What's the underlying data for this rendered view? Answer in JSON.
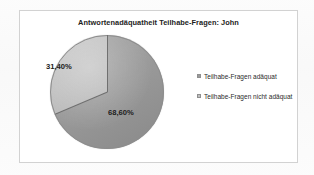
{
  "chart_data": {
    "type": "pie",
    "title": "Antwortenadäquatheit Teilhabe-Fragen: John",
    "categories": [
      "Teilhabe-Fragen adäquat",
      "Teilhabe-Fragen nicht adäquat"
    ],
    "values": [
      68.6,
      31.4
    ],
    "data_labels": [
      "68,60%",
      "31,40%"
    ],
    "legend_position": "right",
    "grid": false,
    "start_angle_deg": 0,
    "direction": "clockwise",
    "colors": [
      "#9a9a9a",
      "#bfbfbf"
    ],
    "slice_border_color": "#8d8d8d"
  },
  "chart": {
    "title": "Antwortenadäquatheit Teilhabe-Fragen: John",
    "plot": {
      "slices": [
        {
          "label": "Teilhabe-Fragen adäquat",
          "percent_text": "68,60%",
          "value": 68.6,
          "color": "#9a9a9a"
        },
        {
          "label": "Teilhabe-Fragen nicht adäquat",
          "percent_text": "31,40%",
          "value": 31.4,
          "color": "#bfbfbf"
        }
      ]
    },
    "legend": {
      "items": [
        {
          "marker": "square-marker-icon",
          "label": "Teilhabe-Fragen adäquat",
          "color": "#9a9a9a"
        },
        {
          "marker": "square-marker-icon",
          "label": "Teilhabe-Fragen nicht adäquat",
          "color": "#bfbfbf"
        }
      ]
    }
  }
}
